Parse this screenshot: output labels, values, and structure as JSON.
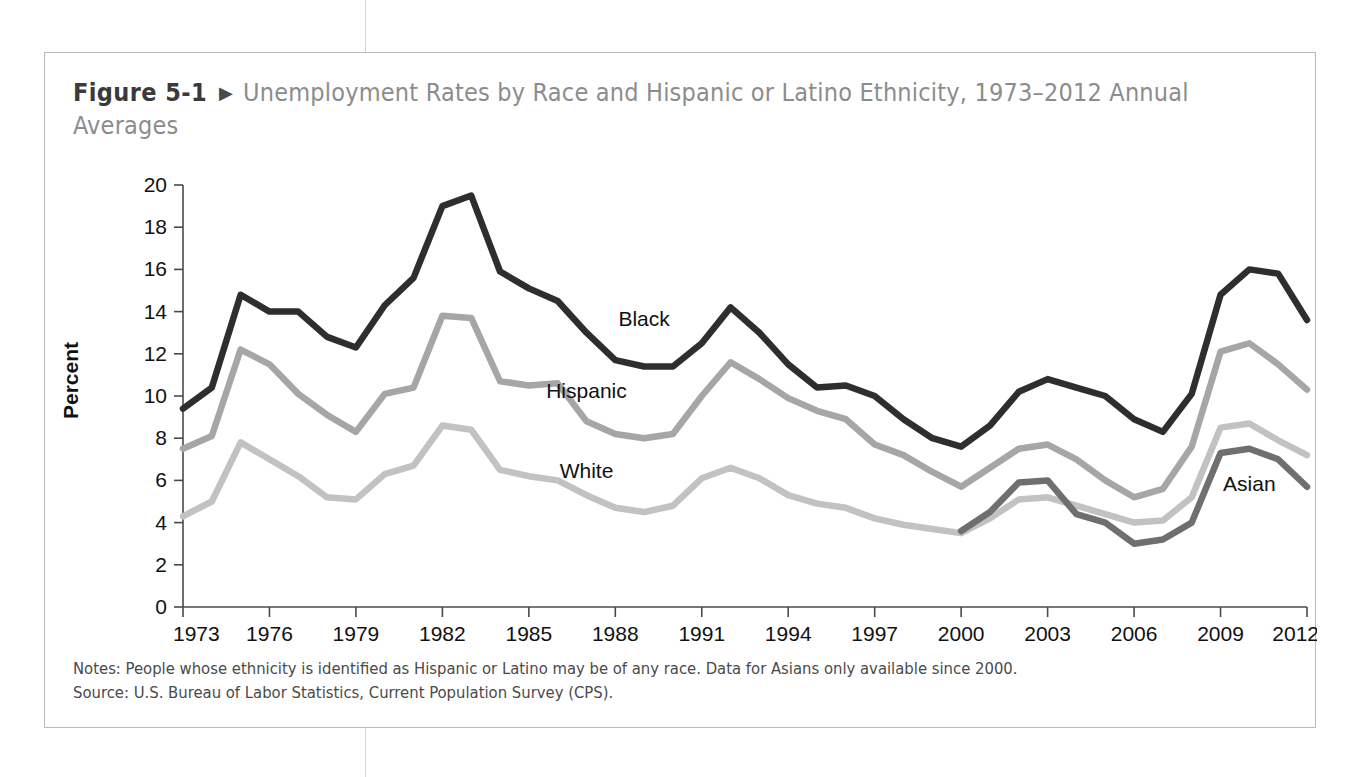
{
  "figure": {
    "number": "Figure 5-1",
    "arrow_icon": "triangle-right-icon",
    "title": "Unemployment Rates by Race and Hispanic or Latino Ethnicity, 1973–2012 Annual Averages",
    "notes": "Notes: People whose ethnicity is identified as Hispanic or Latino may be of any race. Data for Asians only available since 2000.",
    "source": "Source: U.S. Bureau of Labor Statistics, Current Population Survey (CPS)."
  },
  "colors": {
    "black_series": "#2e2e2e",
    "hispanic_series": "#a6a6a6",
    "white_series": "#c2c2c2",
    "asian_series": "#6f6f6f",
    "axis": "#4a4a4a",
    "title_gray": "#8c8c8c",
    "frame": "#b9b9b9"
  },
  "chart_data": {
    "type": "line",
    "title": "Unemployment Rates by Race and Hispanic or Latino Ethnicity, 1973–2012 Annual Averages",
    "xlabel": "",
    "ylabel": "Percent",
    "xlim": [
      1973,
      2012
    ],
    "ylim": [
      0,
      20
    ],
    "ytick_step": 2,
    "yticks": [
      0,
      2,
      4,
      6,
      8,
      10,
      12,
      14,
      16,
      18,
      20
    ],
    "xticks": [
      1973,
      1976,
      1979,
      1982,
      1985,
      1988,
      1991,
      1994,
      1997,
      2000,
      2003,
      2006,
      2009,
      2012
    ],
    "grid": false,
    "legend": "inline-labels",
    "x": [
      1973,
      1974,
      1975,
      1976,
      1977,
      1978,
      1979,
      1980,
      1981,
      1982,
      1983,
      1984,
      1985,
      1986,
      1987,
      1988,
      1989,
      1990,
      1991,
      1992,
      1993,
      1994,
      1995,
      1996,
      1997,
      1998,
      1999,
      2000,
      2001,
      2002,
      2003,
      2004,
      2005,
      2006,
      2007,
      2008,
      2009,
      2010,
      2011,
      2012
    ],
    "series": [
      {
        "name": "Black",
        "color": "#2e2e2e",
        "label_x": 1989,
        "label_y": 13.3,
        "values": [
          9.4,
          10.4,
          14.8,
          14.0,
          14.0,
          12.8,
          12.3,
          14.3,
          15.6,
          19.0,
          19.5,
          15.9,
          15.1,
          14.5,
          13.0,
          11.7,
          11.4,
          11.4,
          12.5,
          14.2,
          13.0,
          11.5,
          10.4,
          10.5,
          10.0,
          8.9,
          8.0,
          7.6,
          8.6,
          10.2,
          10.8,
          10.4,
          10.0,
          8.9,
          8.3,
          10.1,
          14.8,
          16.0,
          15.8,
          13.6
        ]
      },
      {
        "name": "Hispanic",
        "color": "#a6a6a6",
        "label_x": 1987,
        "label_y": 9.9,
        "values": [
          7.5,
          8.1,
          12.2,
          11.5,
          10.1,
          9.1,
          8.3,
          10.1,
          10.4,
          13.8,
          13.7,
          10.7,
          10.5,
          10.6,
          8.8,
          8.2,
          8.0,
          8.2,
          10.0,
          11.6,
          10.8,
          9.9,
          9.3,
          8.9,
          7.7,
          7.2,
          6.4,
          5.7,
          6.6,
          7.5,
          7.7,
          7.0,
          6.0,
          5.2,
          5.6,
          7.6,
          12.1,
          12.5,
          11.5,
          10.3
        ]
      },
      {
        "name": "White",
        "color": "#c2c2c2",
        "label_x": 1987,
        "label_y": 6.1,
        "values": [
          4.3,
          5.0,
          7.8,
          7.0,
          6.2,
          5.2,
          5.1,
          6.3,
          6.7,
          8.6,
          8.4,
          6.5,
          6.2,
          6.0,
          5.3,
          4.7,
          4.5,
          4.8,
          6.1,
          6.6,
          6.1,
          5.3,
          4.9,
          4.7,
          4.2,
          3.9,
          3.7,
          3.5,
          4.2,
          5.1,
          5.2,
          4.8,
          4.4,
          4.0,
          4.1,
          5.2,
          8.5,
          8.7,
          7.9,
          7.2
        ]
      },
      {
        "name": "Asian",
        "color": "#6f6f6f",
        "label_x": 2010,
        "label_y": 5.5,
        "values": [
          null,
          null,
          null,
          null,
          null,
          null,
          null,
          null,
          null,
          null,
          null,
          null,
          null,
          null,
          null,
          null,
          null,
          null,
          null,
          null,
          null,
          null,
          null,
          null,
          null,
          null,
          null,
          3.6,
          4.5,
          5.9,
          6.0,
          4.4,
          4.0,
          3.0,
          3.2,
          4.0,
          7.3,
          7.5,
          7.0,
          5.7
        ]
      }
    ]
  }
}
